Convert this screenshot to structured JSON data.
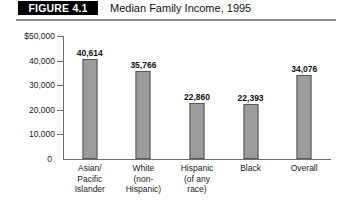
{
  "figure": {
    "tag": "FIGURE 4.1",
    "title": "Median Family Income, 1995"
  },
  "chart_data": {
    "type": "bar",
    "title": "Median Family Income, 1995",
    "xlabel": "",
    "ylabel": "",
    "ylim": [
      0,
      50000
    ],
    "grid": false,
    "legend": null,
    "categories": [
      "Asian/ Pacific Islander",
      "White (non- Hispanic)",
      "Hispanic (of any race)",
      "Black",
      "Overall"
    ],
    "category_lines": [
      [
        "Asian/",
        "Pacific",
        "Islander"
      ],
      [
        "White",
        "(non-",
        "Hispanic)"
      ],
      [
        "Hispanic",
        "(of any",
        "race)"
      ],
      [
        "Black"
      ],
      [
        "Overall"
      ]
    ],
    "values": [
      40614,
      35766,
      22860,
      22393,
      34076
    ],
    "value_labels": [
      "40,614",
      "35,766",
      "22,860",
      "22,393",
      "34,076"
    ],
    "ytick_values": [
      10000,
      20000,
      30000,
      40000,
      50000
    ],
    "ytick_labels": [
      "10,000",
      "20,000",
      "30,000",
      "40,000",
      "$50,000"
    ],
    "zero_label": "0",
    "bar_color": "#9c9c9c",
    "bar_edge_color": "#575757",
    "axis_color": "#6f6f6f"
  }
}
